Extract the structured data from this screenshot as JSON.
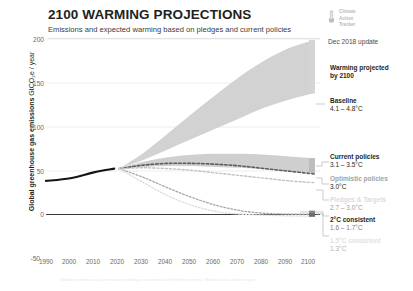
{
  "header": {
    "title": "2100 WARMING PROJECTIONS",
    "subtitle": "Emissions and expected warming based on pledges and current policies"
  },
  "brand": {
    "line1": "Climate",
    "line2": "Action",
    "line3": "Tracker",
    "date": "Dec 2018 update",
    "mark_icon": "thermometer-icon"
  },
  "footnote": "Global greenhouse gas emissions pathways consistent with limiting warming. Shaded areas show ranges.",
  "chart_data": {
    "type": "area",
    "title": "2100 WARMING PROJECTIONS",
    "subtitle": "Emissions and expected warming based on pledges and current policies",
    "xlabel": "",
    "ylabel": "Global greenhouse gas emissions",
    "yunit": "GtCO₂e / year",
    "xlim": [
      1990,
      2100
    ],
    "ylim": [
      -50,
      200
    ],
    "yticks": [
      200,
      150,
      100,
      50,
      0,
      -50
    ],
    "xticks": [
      1990,
      2000,
      2010,
      2020,
      2030,
      2040,
      2050,
      2060,
      2070,
      2080,
      2090,
      2100
    ],
    "grid": true,
    "legend_position": "right",
    "historical": {
      "name": "Historical emissions",
      "x": [
        1990,
        2000,
        2010,
        2018
      ],
      "y": [
        38,
        41,
        48,
        52
      ]
    },
    "series": [
      {
        "name": "Baseline",
        "warming": "4.1 – 4.8°C",
        "low": [
          52,
          62,
          74,
          86,
          98,
          110,
          122,
          131,
          138
        ],
        "high": [
          52,
          70,
          92,
          115,
          137,
          158,
          176,
          190,
          199
        ],
        "x": [
          2020,
          2030,
          2040,
          2050,
          2060,
          2070,
          2080,
          2090,
          2100
        ]
      },
      {
        "name": "Current policies",
        "warming": "3.1 – 3.5°C",
        "low": [
          52,
          54,
          55,
          55,
          54,
          53,
          51,
          49,
          47
        ],
        "high": [
          52,
          60,
          65,
          68,
          69,
          69,
          68,
          66,
          64
        ],
        "x": [
          2020,
          2030,
          2040,
          2050,
          2060,
          2070,
          2080,
          2090,
          2100
        ]
      },
      {
        "name": "Optimistic policies",
        "warming": "3.0°C",
        "x": [
          2020,
          2030,
          2040,
          2050,
          2060,
          2070,
          2080,
          2090,
          2100
        ],
        "y": [
          52,
          56,
          58,
          58,
          57,
          55,
          52,
          49,
          46
        ]
      },
      {
        "name": "Pledges & Targets",
        "warming": "2.7 – 3.0°C",
        "x": [
          2020,
          2030,
          2040,
          2050,
          2060,
          2070,
          2080,
          2090,
          2100
        ],
        "y": [
          52,
          53,
          52,
          50,
          47,
          44,
          41,
          38,
          36
        ]
      },
      {
        "name": "2°C consistent",
        "warming": "1.6 – 1.7°C",
        "x": [
          2020,
          2030,
          2040,
          2050,
          2060,
          2070,
          2080,
          2090,
          2100
        ],
        "y": [
          52,
          42,
          30,
          19,
          10,
          4,
          1,
          0,
          0
        ]
      },
      {
        "name": "1.5°C consistent",
        "warming": "1.3°C",
        "x": [
          2020,
          2030,
          2040,
          2050,
          2060,
          2070,
          2080,
          2090,
          2100
        ],
        "y": [
          52,
          36,
          21,
          10,
          3,
          0,
          -1,
          -2,
          -2
        ]
      }
    ],
    "annotations": [
      {
        "text": "Warming projected by 2100",
        "kind": "heading"
      }
    ]
  },
  "annotations": {
    "warming_projected": {
      "l1": "Warming projected",
      "l2": "by 2100"
    },
    "baseline": {
      "name": "Baseline",
      "value": "4.1 – 4.8°C"
    },
    "current": {
      "name": "Current policies",
      "value": "3.1 – 3.5°C"
    },
    "optimistic": {
      "name": "Optimistic policies",
      "value": "3.0°C"
    },
    "pledges": {
      "name": "Pledges & Targets",
      "value": "2.7 – 3.0°C"
    },
    "two_deg": {
      "name": "2°C consistent",
      "value": "1.6 – 1.7°C"
    },
    "onefive_deg": {
      "name": "1.5°C consistent",
      "value": "1.3°C"
    }
  },
  "axis": {
    "y_title": "Global greenhouse gas emissions",
    "y_unit": "GtCO₂e / year",
    "yticks": [
      "200",
      "150",
      "100",
      "50",
      "0",
      "-50"
    ],
    "xticks": [
      "1990",
      "2000",
      "2010",
      "2020",
      "2030",
      "2040",
      "2050",
      "2060",
      "2070",
      "2080",
      "2090",
      "2100"
    ]
  },
  "colors": {
    "band": "#d2d2d2",
    "band_light": "#dedede",
    "historical": "#1a1a1a",
    "text": "#231f20",
    "muted": "#9a9a9a",
    "faint": "#d9d9d9"
  }
}
